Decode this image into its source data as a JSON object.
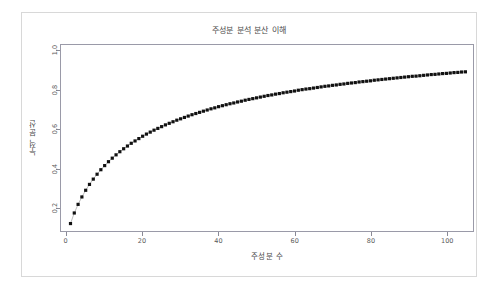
{
  "figure": {
    "width": 502,
    "height": 289,
    "background": "#ffffff",
    "border_color": "#d8d8d8",
    "panel_border_color": "#9a9aa8"
  },
  "chart_data": {
    "type": "line",
    "title": "주성분 분석 분산 이해",
    "subtitle": "",
    "xlabel": "주성분 수",
    "ylabel": "누적 분산",
    "xlim": [
      -1.5,
      107
    ],
    "ylim": [
      0.08,
      1.03
    ],
    "xticks": [
      0,
      20,
      40,
      60,
      80,
      100
    ],
    "xticklabels": [
      "0",
      "20",
      "40",
      "60",
      "80",
      "100"
    ],
    "yticks": [
      0.2,
      0.4,
      0.6,
      0.8,
      1.0
    ],
    "yticklabels": [
      "0.2",
      "0.4",
      "0.6",
      "0.8",
      "1.0"
    ],
    "grid": false,
    "legend": false,
    "marker": "square-dot",
    "marker_color": "#111111",
    "marker_size": 1.6,
    "line_color": "#555555",
    "line_width": 0.4,
    "series": [
      {
        "name": "누적 분산",
        "x": [
          1,
          2,
          3,
          4,
          5,
          6,
          7,
          8,
          9,
          10,
          11,
          12,
          13,
          14,
          15,
          16,
          17,
          18,
          19,
          20,
          21,
          22,
          23,
          24,
          25,
          26,
          27,
          28,
          29,
          30,
          31,
          32,
          33,
          34,
          35,
          36,
          37,
          38,
          39,
          40,
          41,
          42,
          43,
          44,
          45,
          46,
          47,
          48,
          49,
          50,
          51,
          52,
          53,
          54,
          55,
          56,
          57,
          58,
          59,
          60,
          61,
          62,
          63,
          64,
          65,
          66,
          67,
          68,
          69,
          70,
          71,
          72,
          73,
          74,
          75,
          76,
          77,
          78,
          79,
          80,
          81,
          82,
          83,
          84,
          85,
          86,
          87,
          88,
          89,
          90,
          91,
          92,
          93,
          94,
          95,
          96,
          97,
          98,
          99,
          100,
          101,
          102,
          103,
          104,
          105
        ],
        "values": [
          0.118,
          0.172,
          0.216,
          0.254,
          0.288,
          0.318,
          0.345,
          0.37,
          0.393,
          0.414,
          0.434,
          0.452,
          0.469,
          0.485,
          0.5,
          0.514,
          0.528,
          0.54,
          0.552,
          0.564,
          0.575,
          0.585,
          0.595,
          0.604,
          0.613,
          0.622,
          0.63,
          0.638,
          0.646,
          0.653,
          0.66,
          0.667,
          0.674,
          0.68,
          0.686,
          0.692,
          0.698,
          0.704,
          0.709,
          0.715,
          0.72,
          0.725,
          0.73,
          0.734,
          0.739,
          0.743,
          0.748,
          0.752,
          0.756,
          0.76,
          0.764,
          0.768,
          0.772,
          0.775,
          0.779,
          0.782,
          0.786,
          0.789,
          0.792,
          0.795,
          0.799,
          0.802,
          0.805,
          0.807,
          0.81,
          0.813,
          0.816,
          0.819,
          0.821,
          0.824,
          0.826,
          0.829,
          0.831,
          0.834,
          0.836,
          0.838,
          0.841,
          0.843,
          0.845,
          0.847,
          0.85,
          0.852,
          0.854,
          0.856,
          0.858,
          0.86,
          0.862,
          0.864,
          0.866,
          0.868,
          0.87,
          0.871,
          0.873,
          0.875,
          0.877,
          0.879,
          0.88,
          0.882,
          0.884,
          0.885,
          0.887,
          0.889,
          0.89,
          0.892,
          0.893
        ]
      }
    ]
  }
}
